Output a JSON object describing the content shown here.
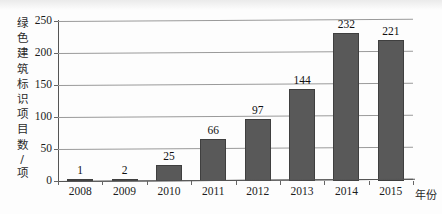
{
  "chart_data": {
    "type": "bar",
    "title": "",
    "subtitle": "",
    "xlabel": "年份",
    "ylabel": "绿色建筑标识项目数/项",
    "categories": [
      "2008",
      "2009",
      "2010",
      "2011",
      "2012",
      "2013",
      "2014",
      "2015"
    ],
    "values": [
      1,
      2,
      25,
      66,
      97,
      144,
      232,
      221
    ],
    "value_labels": [
      "1",
      "2",
      "25",
      "66",
      "97",
      "144",
      "232",
      "221"
    ],
    "ylim": [
      0,
      250
    ],
    "ytick_labels": [
      "0",
      "50",
      "100",
      "150",
      "200",
      "250"
    ],
    "ytick_values": [
      0,
      50,
      100,
      150,
      200,
      250
    ],
    "grid": true,
    "legend": false,
    "legend_position": "none",
    "series": [
      {
        "name": "绿色建筑标识项目数",
        "values": [
          1,
          2,
          25,
          66,
          97,
          144,
          232,
          221
        ]
      }
    ],
    "bar_color": "#595959",
    "grid_color": "#9a9a9a",
    "axis_color": "#555555",
    "text_color": "#1c1c1c"
  },
  "y_axis_title_chars": [
    "绿",
    "色",
    "建",
    "筑",
    "标",
    "识",
    "项",
    "目",
    "数",
    "/",
    "项"
  ]
}
